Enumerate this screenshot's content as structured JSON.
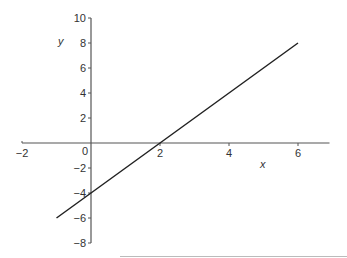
{
  "chart_data": {
    "type": "line",
    "title": "",
    "xlabel": "x",
    "ylabel": "y",
    "xlim": [
      -2,
      7
    ],
    "ylim": [
      -8,
      10
    ],
    "x_ticks": [
      -2,
      0,
      2,
      4,
      6
    ],
    "y_ticks": [
      10,
      8,
      6,
      4,
      2,
      -2,
      -4,
      -6,
      -8
    ],
    "x_tick_labels": [
      "−2",
      "0",
      "2",
      "4",
      "6"
    ],
    "y_tick_labels": [
      "10",
      "8",
      "6",
      "4",
      "2",
      "−2",
      "−4",
      "−6",
      "−8"
    ],
    "grid": false,
    "legend": null,
    "series": [
      {
        "name": "y = 2x − 4",
        "x": [
          -1,
          0,
          2,
          6
        ],
        "y": [
          -6,
          -4,
          0,
          8
        ],
        "color": "#222222"
      }
    ]
  },
  "colors": {
    "axis": "#555555",
    "line": "#222222",
    "text": "#333333"
  }
}
